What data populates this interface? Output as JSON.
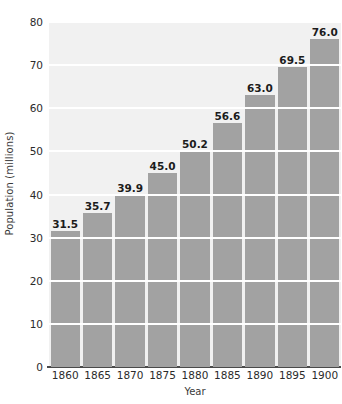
{
  "chart_data": {
    "type": "bar",
    "title": "",
    "xlabel": "Year",
    "ylabel": "Population (millions)",
    "categories": [
      "1860",
      "1865",
      "1870",
      "1875",
      "1880",
      "1885",
      "1890",
      "1895",
      "1900"
    ],
    "values": [
      31.5,
      35.7,
      39.9,
      45.0,
      50.2,
      56.6,
      63.0,
      69.5,
      76.0
    ],
    "value_labels": [
      "31.5",
      "35.7",
      "39.9",
      "45.0",
      "50.2",
      "56.6",
      "63.0",
      "69.5",
      "76.0"
    ],
    "ylim": [
      0,
      80
    ],
    "ytick_values": [
      0,
      10,
      20,
      30,
      40,
      50,
      60,
      70,
      80
    ],
    "ytick_labels": [
      "0",
      "10",
      "20",
      "30",
      "40",
      "50",
      "60",
      "70",
      "80"
    ],
    "grid": true,
    "grid_orientation": "horizontal",
    "legend": null,
    "legend_position": "none",
    "colors": {
      "bar_fill": "#a2a2a2",
      "plot_background": "#f1f1f1",
      "gridline": "#ffffff",
      "axis_line": "#4a4a4a",
      "label_text": "#1c1c1c",
      "tick_text": "#2b2b2b",
      "figure_background": "#ffffff"
    }
  }
}
